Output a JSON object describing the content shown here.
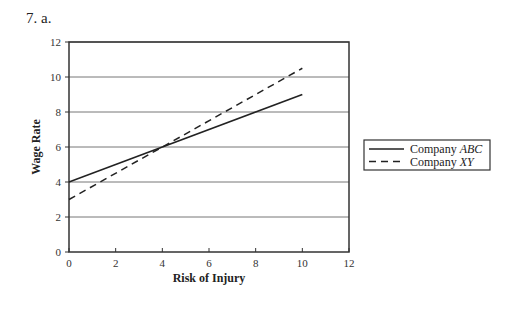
{
  "heading": "7.  a.",
  "chart_data": {
    "type": "line",
    "title": "",
    "xlabel": "Risk of Injury",
    "ylabel": "Wage Rate",
    "xlim": [
      0,
      12
    ],
    "ylim": [
      0,
      12
    ],
    "x_ticks": [
      0,
      2,
      4,
      6,
      8,
      10,
      12
    ],
    "y_ticks": [
      0,
      2,
      4,
      6,
      8,
      10,
      12
    ],
    "grid": "horizontal",
    "legend_position": "right",
    "series": [
      {
        "name": "Company ABC",
        "name_prefix": "Company ",
        "name_italic": "ABC",
        "style": "solid",
        "x": [
          0,
          10
        ],
        "y": [
          4,
          9
        ]
      },
      {
        "name": "Company XY",
        "name_prefix": "Company ",
        "name_italic": "XY",
        "style": "dashed",
        "x": [
          0,
          10
        ],
        "y": [
          3,
          10.5
        ]
      }
    ]
  }
}
